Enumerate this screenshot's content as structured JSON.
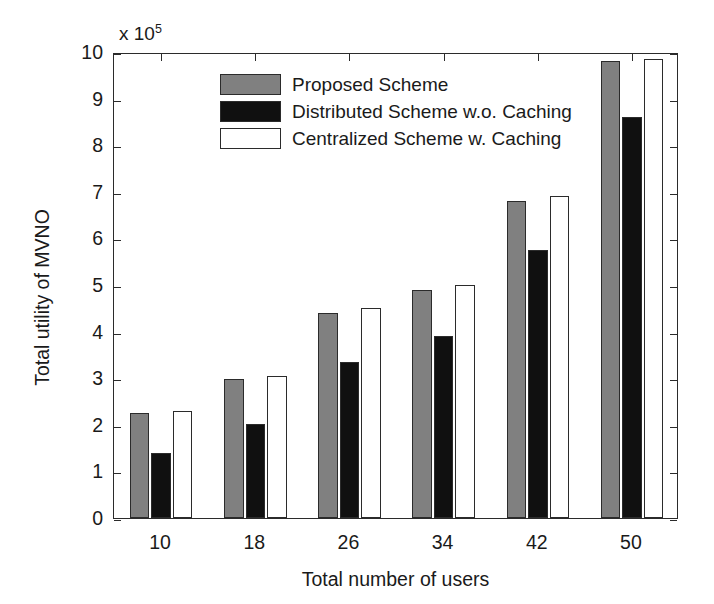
{
  "chart_data": {
    "type": "bar",
    "title": "",
    "xlabel": "Total number of users",
    "ylabel": "Total utility of MVNO",
    "y_exponent_label": "x 10",
    "y_exponent_power": "5",
    "y_multiplier": 100000,
    "categories": [
      "10",
      "18",
      "26",
      "34",
      "42",
      "50"
    ],
    "ytick_labels": [
      "0",
      "1",
      "2",
      "3",
      "4",
      "5",
      "6",
      "7",
      "8",
      "9",
      "10"
    ],
    "ylim": [
      0,
      10
    ],
    "xlim_categories": 6,
    "grid": false,
    "legend_position": "top-center-left",
    "series": [
      {
        "name": "Proposed Scheme",
        "color": "#808080",
        "values": [
          2.25,
          2.98,
          4.4,
          4.9,
          6.8,
          9.8
        ]
      },
      {
        "name": "Distributed Scheme w.o. Caching",
        "color": "#101010",
        "values": [
          1.4,
          2.02,
          3.35,
          3.9,
          5.75,
          8.6
        ]
      },
      {
        "name": "Centralized Scheme w. Caching",
        "color": "#ffffff",
        "values": [
          2.3,
          3.05,
          4.5,
          5.0,
          6.9,
          9.85
        ]
      }
    ]
  }
}
